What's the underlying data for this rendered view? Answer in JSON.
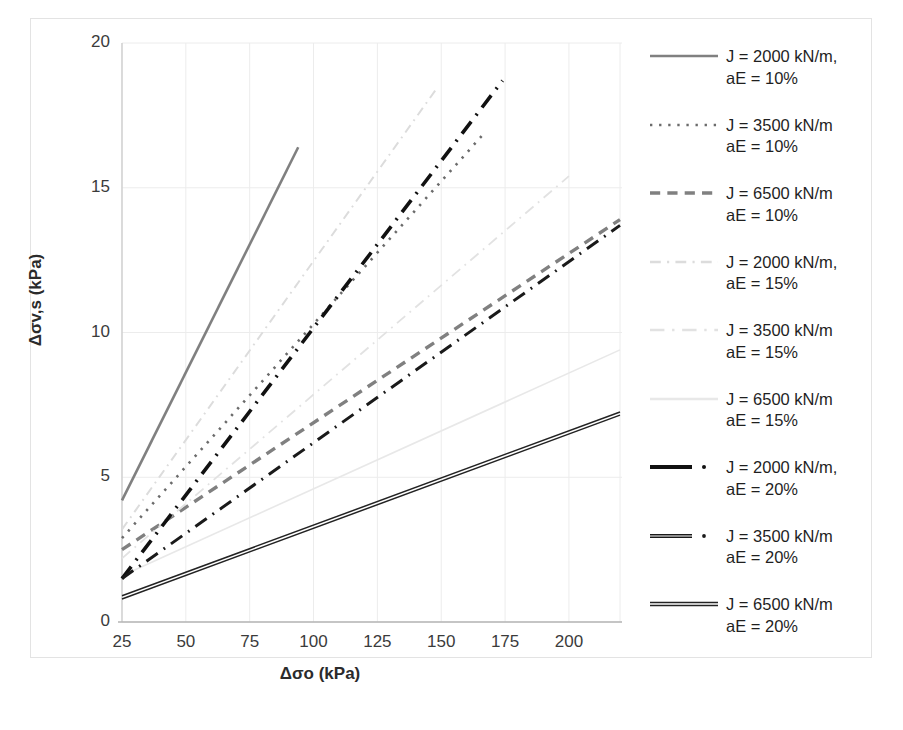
{
  "chart_data": {
    "type": "line",
    "title": "",
    "xlabel": "Δσo (kPa)",
    "ylabel": "Δσv,s (kPa)",
    "xlim": [
      25,
      220
    ],
    "ylim": [
      0,
      20
    ],
    "xticks": [
      "25",
      "50",
      "75",
      "100",
      "125",
      "150",
      "175",
      "200"
    ],
    "xtick_values": [
      25,
      50,
      75,
      100,
      125,
      150,
      175,
      200
    ],
    "yticks": [
      "0",
      "5",
      "10",
      "15",
      "20"
    ],
    "ytick_values": [
      0,
      5,
      10,
      15,
      20
    ],
    "grid": true,
    "legend_position": "right",
    "series": [
      {
        "name": "J = 2000 kN/m,\naE = 10%",
        "label_line1": "J = 2000 kN/m,",
        "label_line2": "aE = 10%",
        "style": "solid",
        "color": "#808080",
        "width": 2.6,
        "x": [
          25,
          94
        ],
        "y": [
          4.2,
          16.4
        ]
      },
      {
        "name": "J = 3500 kN/m\naE = 10%",
        "label_line1": "J = 3500 kN/m",
        "label_line2": "aE = 10%",
        "style": "dotted",
        "color": "#6b6b6b",
        "width": 2.6,
        "x": [
          25,
          166
        ],
        "y": [
          2.9,
          16.8
        ]
      },
      {
        "name": "J = 6500 kN/m\naE = 10%",
        "label_line1": "J = 6500 kN/m",
        "label_line2": "aE = 10%",
        "style": "dashed",
        "color": "#808080",
        "width": 3.4,
        "x": [
          25,
          220
        ],
        "y": [
          2.5,
          13.9
        ]
      },
      {
        "name": "J = 2000 kN/m,\naE = 15%",
        "label_line1": "J = 2000 kN/m,",
        "label_line2": "aE = 15%",
        "style": "dashdot",
        "color": "#dcdcdc",
        "width": 2.0,
        "x": [
          25,
          148
        ],
        "y": [
          3.2,
          18.4
        ]
      },
      {
        "name": "J = 3500 kN/m\naE = 15%",
        "label_line1": "J = 3500 kN/m",
        "label_line2": "aE = 15%",
        "style": "dashdot-long",
        "color": "#e2e2e2",
        "width": 1.8,
        "x": [
          25,
          200
        ],
        "y": [
          2.2,
          15.4
        ]
      },
      {
        "name": "J = 6500 kN/m\naE = 15%",
        "label_line1": "J = 6500 kN/m",
        "label_line2": "aE = 15%",
        "style": "solid-faint",
        "color": "#e8e8e8",
        "width": 1.6,
        "x": [
          25,
          220
        ],
        "y": [
          1.6,
          9.4
        ]
      },
      {
        "name": "J = 2000 kN/m,\naE = 20%",
        "label_line1": "J = 2000 kN/m,",
        "label_line2": "aE = 20%",
        "style": "dashdot-bold",
        "color": "#111111",
        "width": 3.6,
        "x": [
          25,
          174
        ],
        "y": [
          1.5,
          18.7
        ]
      },
      {
        "name": "J = 3500 kN/m\naE = 20%",
        "label_line1": "J = 3500 kN/m",
        "label_line2": "aE = 20%",
        "style": "dashdot-thin",
        "color": "#1a1a1a",
        "width": 3.0,
        "x": [
          25,
          220
        ],
        "y": [
          1.5,
          13.7
        ]
      },
      {
        "name": "J = 6500 kN/m\naE = 20%",
        "label_line1": "J = 6500 kN/m",
        "label_line2": "aE = 20%",
        "style": "solid-double",
        "color": "#232323",
        "width": 2.2,
        "x": [
          25,
          220
        ],
        "y": [
          0.85,
          7.2
        ]
      }
    ]
  },
  "axes": {
    "y_label": "Δσv,s (kPa)",
    "x_label": "Δσo (kPa)"
  },
  "legend": {
    "entries": [
      {
        "line1": "J = 2000 kN/m,",
        "line2": "aE = 10%",
        "key": "solid-gray-key"
      },
      {
        "line1": "J = 3500 kN/m",
        "line2": "aE = 10%",
        "key": "dotted-gray-key"
      },
      {
        "line1": "J = 6500 kN/m",
        "line2": "aE = 10%",
        "key": "dashed-gray-key"
      },
      {
        "line1": "J = 2000 kN/m,",
        "line2": "aE = 15%",
        "key": "dashdot-faint-key"
      },
      {
        "line1": "J = 3500 kN/m",
        "line2": "aE = 15%",
        "key": "dashdot-faint-long-key"
      },
      {
        "line1": "J = 6500 kN/m",
        "line2": "aE = 15%",
        "key": "solid-faint-key"
      },
      {
        "line1": "J = 2000 kN/m,",
        "line2": "aE = 20%",
        "key": "dashdot-black-key"
      },
      {
        "line1": "J = 3500 kN/m",
        "line2": "aE = 20%",
        "key": "dashdot-black-thin-key"
      },
      {
        "line1": "J = 6500 kN/m",
        "line2": "aE = 20%",
        "key": "solid-black-key"
      }
    ]
  },
  "colors": {
    "grid": "#ececec",
    "axis": "#d9d9d9",
    "text": "#262626",
    "background": "#ffffff"
  }
}
